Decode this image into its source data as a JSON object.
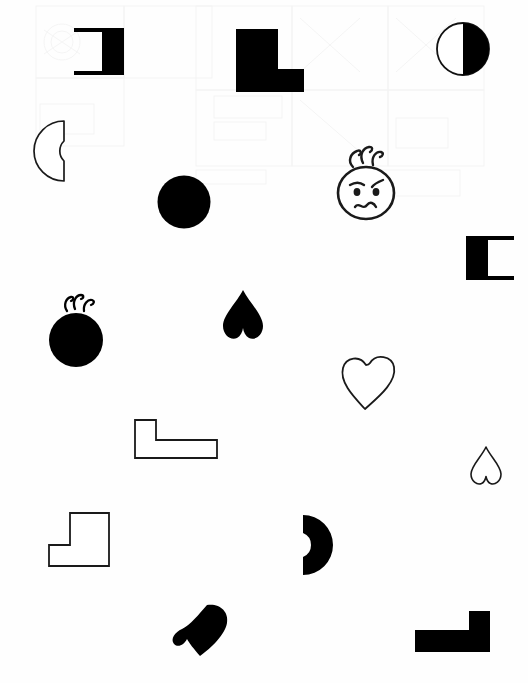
{
  "page": {
    "width": 528,
    "height": 683,
    "background_color": "#fefefe",
    "ink_color": "#000000",
    "outline_color": "#1a1a1a",
    "bleed_through": {
      "present": true,
      "opacity": 0.055,
      "note": "faint ghost marks from the reverse side of the page, mostly in the upper half"
    }
  },
  "shapes": [
    {
      "id": "bracket-right-open-left",
      "label": "Right bracket",
      "icon": "bracket-right-icon",
      "kind": "bracket",
      "fill": "filled",
      "color": "#000000",
      "x": 74,
      "y": 28,
      "w": 50,
      "h": 47
    },
    {
      "id": "l-shape-filled-large",
      "label": "Filled L shape",
      "icon": "l-shape-icon",
      "kind": "l-shape",
      "fill": "filled",
      "color": "#000000",
      "x": 236,
      "y": 29,
      "w": 68,
      "h": 63
    },
    {
      "id": "circle-half-filled",
      "label": "Half filled circle",
      "icon": "half-circle-icon",
      "kind": "circle",
      "fill": "half",
      "color": "#000000",
      "x": 436,
      "y": 22,
      "w": 54,
      "h": 54
    },
    {
      "id": "crescent-outline-open-right",
      "label": "Outlined crescent",
      "icon": "crescent-icon",
      "kind": "crescent",
      "fill": "outline",
      "color": "#1a1a1a",
      "x": 20,
      "y": 120,
      "w": 48,
      "h": 62
    },
    {
      "id": "circle-filled-plain",
      "label": "Filled circle",
      "icon": "circle-icon",
      "kind": "circle",
      "fill": "filled",
      "color": "#000000",
      "x": 157,
      "y": 175,
      "w": 54,
      "h": 54
    },
    {
      "id": "face-angry",
      "label": "Cartoon face with hair",
      "icon": "angry-face-icon",
      "kind": "face",
      "fill": "outline",
      "color": "#1a1a1a",
      "x": 333,
      "y": 145,
      "w": 66,
      "h": 78
    },
    {
      "id": "bracket-left-open-right",
      "label": "Left bracket",
      "icon": "bracket-left-icon",
      "kind": "bracket",
      "fill": "filled",
      "color": "#000000",
      "x": 466,
      "y": 236,
      "w": 48,
      "h": 44
    },
    {
      "id": "circle-filled-haired",
      "label": "Filled circle with hair",
      "icon": "haired-circle-icon",
      "kind": "circle",
      "fill": "filled",
      "color": "#000000",
      "x": 43,
      "y": 293,
      "w": 66,
      "h": 74
    },
    {
      "id": "heart-filled-inverted",
      "label": "Filled inverted heart",
      "icon": "heart-icon",
      "kind": "heart",
      "fill": "filled",
      "color": "#000000",
      "x": 222,
      "y": 289,
      "w": 42,
      "h": 52
    },
    {
      "id": "heart-outline-tilted",
      "label": "Outlined heart",
      "icon": "heart-outline-icon",
      "kind": "heart",
      "fill": "outline",
      "color": "#1a1a1a",
      "x": 340,
      "y": 353,
      "w": 58,
      "h": 58
    },
    {
      "id": "l-shape-outline-wide",
      "label": "Outlined L shape",
      "icon": "l-shape-outline-icon",
      "kind": "l-shape",
      "fill": "outline",
      "color": "#1a1a1a",
      "x": 134,
      "y": 419,
      "w": 84,
      "h": 40
    },
    {
      "id": "heart-outline-small",
      "label": "Small outlined heart",
      "icon": "heart-outline-icon",
      "kind": "heart",
      "fill": "outline",
      "color": "#1a1a1a",
      "x": 470,
      "y": 446,
      "w": 32,
      "h": 40
    },
    {
      "id": "step-shape-outline",
      "label": "Outlined step shape",
      "icon": "step-shape-icon",
      "kind": "step",
      "fill": "outline",
      "color": "#1a1a1a",
      "x": 48,
      "y": 512,
      "w": 62,
      "h": 55
    },
    {
      "id": "crescent-filled-open-left",
      "label": "Filled crescent",
      "icon": "crescent-filled-icon",
      "kind": "crescent",
      "fill": "filled",
      "color": "#000000",
      "x": 301,
      "y": 514,
      "w": 36,
      "h": 62
    },
    {
      "id": "heart-filled-rotated",
      "label": "Filled rotated heart",
      "icon": "heart-icon",
      "kind": "heart",
      "fill": "filled",
      "color": "#000000",
      "x": 172,
      "y": 602,
      "w": 58,
      "h": 56
    },
    {
      "id": "l-shape-filled-rotated",
      "label": "Filled rotated L shape",
      "icon": "l-shape-icon",
      "kind": "l-shape",
      "fill": "filled",
      "color": "#000000",
      "x": 415,
      "y": 611,
      "w": 75,
      "h": 41
    }
  ]
}
